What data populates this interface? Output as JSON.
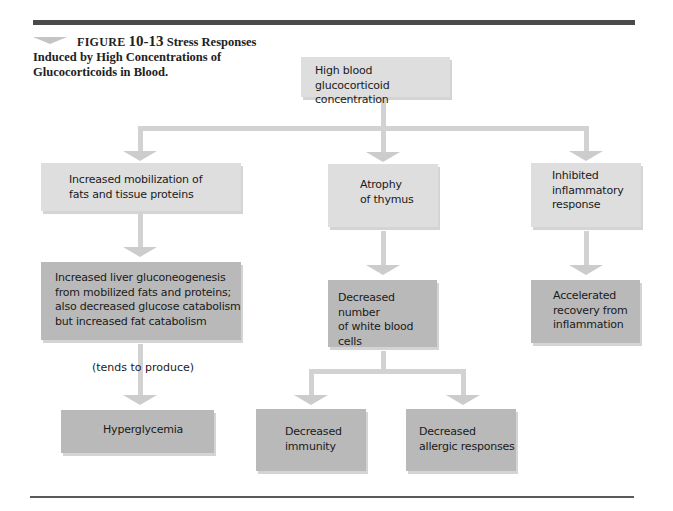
{
  "figure": {
    "label": "FIGURE",
    "number": "10-13",
    "title_first": "Stress",
    "title_rest": "Responses Induced by High Concentrations of Glucocorticoids in Blood."
  },
  "nodes": {
    "root": {
      "text": "High blood glucocorticoid concentration",
      "lines": [
        "High blood glucocorticoid",
        "concentration"
      ],
      "shade": "light"
    },
    "mobilization": {
      "lines": [
        "Increased mobilization of",
        "fats and tissue proteins"
      ],
      "shade": "light"
    },
    "thymus": {
      "lines": [
        "Atrophy",
        "of thymus"
      ],
      "shade": "light"
    },
    "inflammatory": {
      "lines": [
        "Inhibited",
        "inflammatory",
        "response"
      ],
      "shade": "light"
    },
    "gluconeogenesis": {
      "lines": [
        "Increased liver gluconeogenesis",
        "from mobilized fats and proteins;",
        "also decreased glucose catabolism",
        "but increased fat catabolism"
      ],
      "shade": "dark"
    },
    "white_cells": {
      "lines": [
        "Decreased number",
        "of white blood",
        "cells"
      ],
      "shade": "dark"
    },
    "recovery": {
      "lines": [
        "Accelerated",
        "recovery from",
        "inflammation"
      ],
      "shade": "dark"
    },
    "hyperglycemia": {
      "lines": [
        "Hyperglycemia"
      ],
      "shade": "dark"
    },
    "immunity": {
      "lines": [
        "Decreased",
        "immunity"
      ],
      "shade": "dark"
    },
    "allergic": {
      "lines": [
        "Decreased",
        "allergic responses"
      ],
      "shade": "dark"
    }
  },
  "edge_labels": {
    "tends_to_produce": "(tends to produce)"
  },
  "edges": [
    [
      "root",
      "mobilization"
    ],
    [
      "root",
      "thymus"
    ],
    [
      "root",
      "inflammatory"
    ],
    [
      "mobilization",
      "gluconeogenesis"
    ],
    [
      "thymus",
      "white_cells"
    ],
    [
      "inflammatory",
      "recovery"
    ],
    [
      "gluconeogenesis",
      "hyperglycemia"
    ],
    [
      "white_cells",
      "immunity"
    ],
    [
      "white_cells",
      "allergic"
    ]
  ],
  "colors": {
    "light_box": "#dedede",
    "dark_box": "#b9b9b9",
    "connector": "#d2d2d2",
    "rule": "#4a4a4a"
  }
}
